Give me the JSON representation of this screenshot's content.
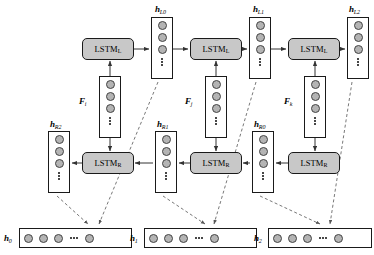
{
  "figure": {
    "type": "diagram",
    "background_color": "#ffffff",
    "line_color": "#333333",
    "cell_fill": "#c8c8c8",
    "node_fill": "#b4b4b4",
    "dashed_color": "#555555"
  },
  "lstm_cells": [
    {
      "id": "lstm-l-0",
      "name": "LSTM",
      "sub": "L",
      "x": 82,
      "y": 38,
      "w": 52,
      "h": 22
    },
    {
      "id": "lstm-l-1",
      "name": "LSTM",
      "sub": "L",
      "x": 190,
      "y": 38,
      "w": 52,
      "h": 22
    },
    {
      "id": "lstm-l-2",
      "name": "LSTM",
      "sub": "L",
      "x": 288,
      "y": 38,
      "w": 52,
      "h": 22
    },
    {
      "id": "lstm-r-0",
      "name": "LSTM",
      "sub": "R",
      "x": 82,
      "y": 152,
      "w": 52,
      "h": 22
    },
    {
      "id": "lstm-r-1",
      "name": "LSTM",
      "sub": "R",
      "x": 190,
      "y": 152,
      "w": 52,
      "h": 22
    },
    {
      "id": "lstm-r-2",
      "name": "LSTM",
      "sub": "R",
      "x": 288,
      "y": 152,
      "w": 52,
      "h": 22
    }
  ],
  "hidden_left": [
    {
      "id": "h-l0",
      "label_var": "h",
      "label_sub": "L0",
      "x": 151,
      "y": 17,
      "w": 22,
      "h": 62,
      "label_x": 155,
      "label_y": 4,
      "dots": 3
    },
    {
      "id": "h-l1",
      "label_var": "h",
      "label_sub": "L1",
      "x": 249,
      "y": 17,
      "w": 22,
      "h": 62,
      "label_x": 253,
      "label_y": 4,
      "dots": 3
    },
    {
      "id": "h-l2",
      "label_var": "h",
      "label_sub": "L2",
      "x": 347,
      "y": 17,
      "w": 22,
      "h": 62,
      "label_x": 349,
      "label_y": 4,
      "dots": 3
    }
  ],
  "hidden_right": [
    {
      "id": "h-r2",
      "label_var": "h",
      "label_sub": "R2",
      "x": 48,
      "y": 131,
      "w": 22,
      "h": 62,
      "label_x": 50,
      "label_y": 119,
      "dots": 3
    },
    {
      "id": "h-r1",
      "label_var": "h",
      "label_sub": "R1",
      "x": 155,
      "y": 131,
      "w": 22,
      "h": 62,
      "label_x": 157,
      "label_y": 119,
      "dots": 3
    },
    {
      "id": "h-r0",
      "label_var": "h",
      "label_sub": "R0",
      "x": 252,
      "y": 131,
      "w": 22,
      "h": 62,
      "label_x": 254,
      "label_y": 119,
      "dots": 3
    }
  ],
  "features": [
    {
      "id": "f-i",
      "label_var": "F",
      "label_sub": "i",
      "x": 99,
      "y": 76,
      "w": 22,
      "h": 62,
      "label_x": 79,
      "label_y": 96,
      "dots": 3
    },
    {
      "id": "f-j",
      "label_var": "F",
      "label_sub": "j",
      "x": 205,
      "y": 76,
      "w": 22,
      "h": 62,
      "label_x": 185,
      "label_y": 96,
      "dots": 3
    },
    {
      "id": "f-k",
      "label_var": "F",
      "label_sub": "k",
      "x": 304,
      "y": 76,
      "w": 22,
      "h": 62,
      "label_x": 284,
      "label_y": 96,
      "dots": 3
    }
  ],
  "outputs": [
    {
      "id": "h-0",
      "label_var": "h",
      "label_sub": "0",
      "x": 19,
      "y": 228,
      "w": 113,
      "h": 20,
      "label_x": 4,
      "label_y": 233,
      "circles": 4
    },
    {
      "id": "h-1",
      "label_var": "h",
      "label_sub": "1",
      "x": 144,
      "y": 228,
      "w": 113,
      "h": 20,
      "label_x": 130,
      "label_y": 233,
      "circles": 4
    },
    {
      "id": "h-2",
      "label_var": "h",
      "label_sub": "2",
      "x": 268,
      "y": 228,
      "w": 104,
      "h": 20,
      "label_x": 254,
      "label_y": 233,
      "circles": 4
    }
  ],
  "edges": {
    "solid": [
      {
        "name": "lstm-l0-to-hl0",
        "x1": 134,
        "y1": 49,
        "x2": 149,
        "y2": 49,
        "arrow": true
      },
      {
        "name": "hl0-to-lstm-l1",
        "x1": 173,
        "y1": 49,
        "x2": 188,
        "y2": 49,
        "arrow": true
      },
      {
        "name": "lstm-l1-to-hl1",
        "x1": 242,
        "y1": 49,
        "x2": 247,
        "y2": 49,
        "arrow": true
      },
      {
        "name": "hl1-to-lstm-l2",
        "x1": 271,
        "y1": 49,
        "x2": 286,
        "y2": 49,
        "arrow": true
      },
      {
        "name": "lstm-l2-to-hl2",
        "x1": 340,
        "y1": 49,
        "x2": 345,
        "y2": 49,
        "arrow": true
      },
      {
        "name": "fi-to-lstm-l0",
        "x1": 110,
        "y1": 76,
        "x2": 110,
        "y2": 61,
        "arrow": true
      },
      {
        "name": "fj-to-lstm-l1",
        "x1": 216,
        "y1": 76,
        "x2": 216,
        "y2": 61,
        "arrow": true
      },
      {
        "name": "fk-to-lstm-l2",
        "x1": 315,
        "y1": 76,
        "x2": 315,
        "y2": 61,
        "arrow": true
      },
      {
        "name": "fi-to-lstm-r0",
        "x1": 110,
        "y1": 138,
        "x2": 110,
        "y2": 151,
        "arrow": true
      },
      {
        "name": "fj-to-lstm-r1",
        "x1": 216,
        "y1": 138,
        "x2": 216,
        "y2": 151,
        "arrow": true
      },
      {
        "name": "fk-to-lstm-r2",
        "x1": 315,
        "y1": 138,
        "x2": 315,
        "y2": 151,
        "arrow": true
      },
      {
        "name": "lstm-r0-to-hr2",
        "x1": 82,
        "y1": 163,
        "x2": 72,
        "y2": 163,
        "arrow": true
      },
      {
        "name": "hr1-to-lstm-r0",
        "x1": 153,
        "y1": 163,
        "x2": 135,
        "y2": 163,
        "arrow": true
      },
      {
        "name": "lstm-r1-to-hr1",
        "x1": 190,
        "y1": 163,
        "x2": 179,
        "y2": 163,
        "arrow": true
      },
      {
        "name": "hr0-to-lstm-r1",
        "x1": 250,
        "y1": 163,
        "x2": 243,
        "y2": 163,
        "arrow": true
      },
      {
        "name": "lstm-r2-to-hr0",
        "x1": 288,
        "y1": 163,
        "x2": 276,
        "y2": 163,
        "arrow": true
      }
    ],
    "dashed": [
      {
        "name": "hl0-to-h0",
        "x1": 158,
        "y1": 82,
        "x2": 99,
        "y2": 224,
        "arrow": true
      },
      {
        "name": "hr2-to-h0",
        "x1": 57,
        "y1": 196,
        "x2": 88,
        "y2": 224,
        "arrow": true
      },
      {
        "name": "hl1-to-h1",
        "x1": 256,
        "y1": 82,
        "x2": 214,
        "y2": 224,
        "arrow": true
      },
      {
        "name": "hr1-to-h1",
        "x1": 163,
        "y1": 196,
        "x2": 205,
        "y2": 224,
        "arrow": true
      },
      {
        "name": "hl2-to-h2",
        "x1": 352,
        "y1": 82,
        "x2": 330,
        "y2": 224,
        "arrow": true
      },
      {
        "name": "hr0-to-h2",
        "x1": 260,
        "y1": 196,
        "x2": 320,
        "y2": 224,
        "arrow": true
      }
    ]
  }
}
